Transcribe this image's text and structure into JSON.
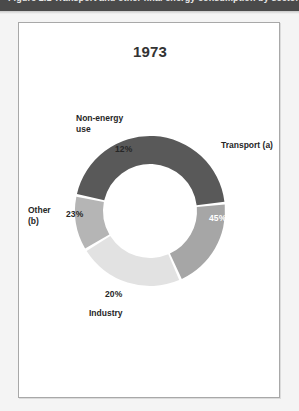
{
  "banner": {
    "caption": "Figure 2.1   Transport and other final energy consumption by sector"
  },
  "panel": {
    "title": "1973"
  },
  "chart_data": {
    "type": "pie",
    "variant": "donut",
    "title": "1973",
    "xlabel": "",
    "ylabel": "",
    "unit": "%",
    "legend_position": "around-slices",
    "grid": false,
    "total": 100,
    "categories": [
      "Transport (a)",
      "Industry",
      "Other (b)",
      "Non-energy use"
    ],
    "values": [
      45,
      20,
      23,
      12
    ],
    "value_labels": [
      "45%",
      "20%",
      "23%",
      "12%"
    ],
    "colors": [
      "#595959",
      "#a6a6a6",
      "#e2e2e2",
      "#b5b5b5"
    ],
    "label_text_colors": [
      "#ffffff",
      "#262626",
      "#262626",
      "#262626"
    ],
    "slices": [
      {
        "name": "Transport (a)",
        "label": "Transport (a)",
        "value": 45,
        "value_label": "45%",
        "color": "#595959",
        "start_angle": 0,
        "end_angle": 162
      },
      {
        "name": "Industry",
        "label": "Industry",
        "value": 20,
        "value_label": "20%",
        "color": "#a6a6a6",
        "start_angle": 162,
        "end_angle": 234
      },
      {
        "name": "Other (b)",
        "label": "Other\n(b)",
        "value": 23,
        "value_label": "23%",
        "color": "#e2e2e2",
        "start_angle": 234,
        "end_angle": 316.8
      },
      {
        "name": "Non-energy use",
        "label": "Non-energy\nuse",
        "value": 12,
        "value_label": "12%",
        "color": "#b5b5b5",
        "start_angle": 316.8,
        "end_angle": 360
      }
    ]
  }
}
